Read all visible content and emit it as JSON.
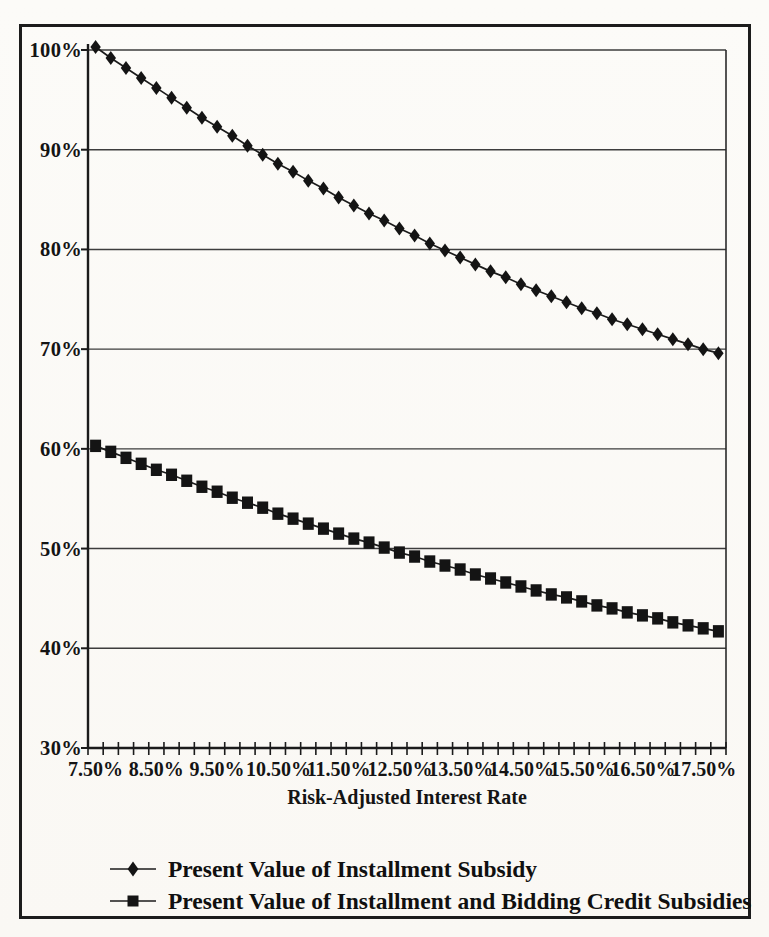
{
  "figure": {
    "background": "#fbfaf6",
    "border_color": "#1c1c1c",
    "ink_color": "#141414"
  },
  "chart_data": {
    "type": "line",
    "title": "",
    "xlabel": "Risk-Adjusted Interest Rate",
    "ylabel": "",
    "grid": "horizontal",
    "legend_position": "bottom-left",
    "line_color": "#1b1b1b",
    "marker_color": "#141414",
    "ylim": [
      30,
      100
    ],
    "y_ticks": [
      100,
      90,
      80,
      70,
      60,
      50,
      40,
      30
    ],
    "y_tick_labels": [
      "100%",
      "90%",
      "80%",
      "70%",
      "60%",
      "50%",
      "40%",
      "30%"
    ],
    "x_tick_labels": [
      "7.50%",
      "8.50%",
      "9.50%",
      "10.50%",
      "11.50%",
      "12.50%",
      "13.50%",
      "14.50%",
      "15.50%",
      "16.50%",
      "17.50%"
    ],
    "x_label_every_n_points": 4,
    "x": [
      7.5,
      7.75,
      8.0,
      8.25,
      8.5,
      8.75,
      9.0,
      9.25,
      9.5,
      9.75,
      10.0,
      10.25,
      10.5,
      10.75,
      11.0,
      11.25,
      11.5,
      11.75,
      12.0,
      12.25,
      12.5,
      12.75,
      13.0,
      13.25,
      13.5,
      13.75,
      14.0,
      14.25,
      14.5,
      14.75,
      15.0,
      15.25,
      15.5,
      15.75,
      16.0,
      16.25,
      16.5,
      16.75,
      17.0,
      17.25,
      17.5,
      17.75
    ],
    "series": [
      {
        "name": "Present Value of Installment Subsidy",
        "marker": "diamond",
        "values": [
          100.3,
          99.2,
          98.2,
          97.2,
          96.2,
          95.2,
          94.2,
          93.2,
          92.3,
          91.4,
          90.4,
          89.5,
          88.6,
          87.8,
          86.9,
          86.1,
          85.2,
          84.4,
          83.6,
          82.9,
          82.1,
          81.4,
          80.6,
          79.9,
          79.2,
          78.5,
          77.8,
          77.2,
          76.5,
          75.9,
          75.3,
          74.7,
          74.1,
          73.6,
          73.0,
          72.5,
          72.0,
          71.5,
          71.0,
          70.5,
          70.0,
          69.6
        ]
      },
      {
        "name": "Present Value of Installment and Bidding Credit Subsidies",
        "marker": "square",
        "values": [
          60.3,
          59.7,
          59.1,
          58.5,
          57.9,
          57.4,
          56.8,
          56.2,
          55.7,
          55.1,
          54.6,
          54.1,
          53.5,
          53.0,
          52.5,
          52.0,
          51.5,
          51.0,
          50.6,
          50.1,
          49.6,
          49.2,
          48.7,
          48.3,
          47.9,
          47.4,
          47.0,
          46.6,
          46.2,
          45.8,
          45.4,
          45.1,
          44.7,
          44.3,
          44.0,
          43.6,
          43.3,
          43.0,
          42.6,
          42.3,
          42.0,
          41.7
        ]
      }
    ]
  }
}
